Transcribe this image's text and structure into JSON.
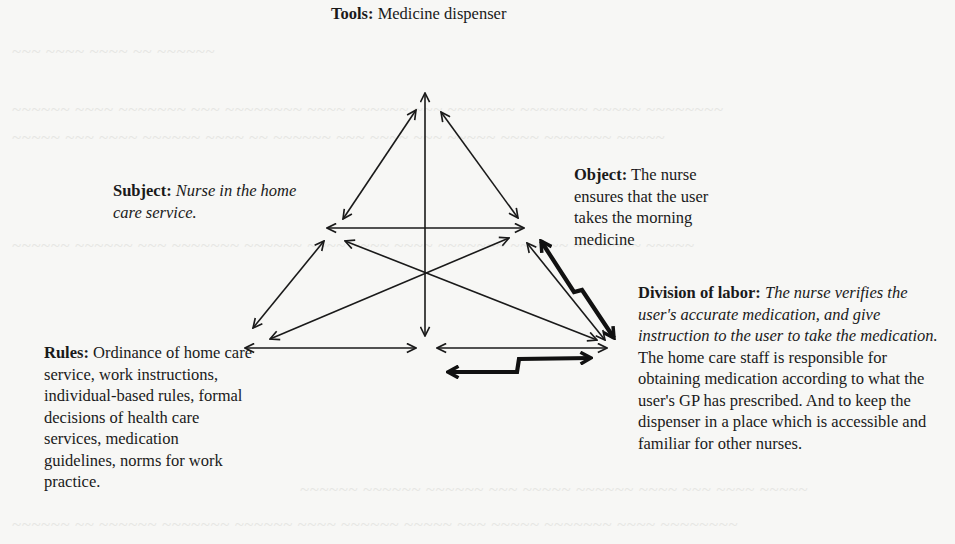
{
  "diagram": {
    "type": "activity-system-triangle",
    "nodes": {
      "tools": {
        "heading": "Tools:",
        "text": "Medicine dispenser"
      },
      "subject": {
        "heading": "Subject:",
        "text_italic": "Nurse in the home care service."
      },
      "object": {
        "heading": "Object:",
        "text": "The nurse ensures that the user takes the morning medicine"
      },
      "division_of_labor": {
        "heading": "Division of labor:",
        "text_italic": "The nurse verifies the user's accurate medication, and give instruction to the user to take the medication.",
        "text": "The home care staff is responsible for obtaining medication according to what the user's GP has prescribed. And to keep the dispenser in a place which is accessible and familiar  for other nurses."
      },
      "rules": {
        "heading": "Rules:",
        "text": "Ordinance of home care service, work instructions, individual-based rules, formal decisions of health care services, medication guidelines, norms for work practice."
      }
    },
    "connections": [
      {
        "from": "subject",
        "to": "tools",
        "style": "double-arrow"
      },
      {
        "from": "object",
        "to": "tools",
        "style": "double-arrow"
      },
      {
        "from": "community",
        "to": "tools",
        "style": "double-arrow"
      },
      {
        "from": "subject",
        "to": "object",
        "style": "double-arrow"
      },
      {
        "from": "subject",
        "to": "rules",
        "style": "double-arrow"
      },
      {
        "from": "subject",
        "to": "division_of_labor",
        "style": "double-arrow"
      },
      {
        "from": "object",
        "to": "rules",
        "style": "double-arrow"
      },
      {
        "from": "object",
        "to": "division_of_labor",
        "style": "double-arrow"
      },
      {
        "from": "rules",
        "to": "community",
        "style": "double-arrow"
      },
      {
        "from": "community",
        "to": "division_of_labor",
        "style": "double-arrow"
      },
      {
        "from": "object",
        "to": "division_of_labor",
        "style": "lightning-contradiction"
      },
      {
        "from": "community",
        "to": "division_of_labor",
        "style": "lightning-contradiction"
      }
    ]
  },
  "colors": {
    "background": "#f7f7f5",
    "ink": "#1a1a1a"
  }
}
